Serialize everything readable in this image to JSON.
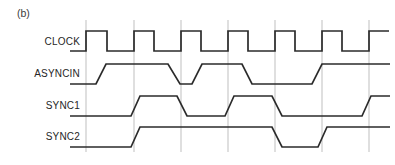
{
  "figure": {
    "caption": "(b)",
    "background": "#ffffff",
    "width": 395,
    "height": 165
  },
  "colors": {
    "wave_stroke": "#2b2b2b",
    "grid_stroke": "#bfbfbf",
    "label_text": "#262626",
    "caption_text": "#3b3b3b"
  },
  "grid": {
    "label": "clock-edge-gridlines",
    "x_positions": [
      86,
      134,
      181,
      228,
      275,
      322,
      369
    ],
    "y_top": 20,
    "y_bottom": 152
  },
  "chart_data": {
    "type": "line",
    "title": "(b)",
    "xlabel": "",
    "ylabel": "",
    "subtitle": "Digital timing diagram: two-stage synchronizer",
    "grid": true,
    "legend_position": "left-axis-labels",
    "x_axis": {
      "type": "time",
      "start": 70,
      "end": 390,
      "clock_period_px": 47,
      "clock_high_px": 21,
      "gridlines_at_rising_edges": true,
      "tick_labels": []
    },
    "signals": [
      {
        "name": "CLOCK",
        "label": "CLOCK",
        "y_high": 31,
        "y_low": 51,
        "edge_style": "square",
        "initial_level": "low",
        "transitions_px": [
          86,
          107,
          134,
          154,
          181,
          201,
          228,
          248,
          275,
          295,
          322,
          342,
          369,
          389
        ],
        "points": "70,51 86,51 86,31 107,31 107,51 134,51 134,31 154,31 154,51 181,51 181,31 201,31 201,51 228,51 228,31 248,31 248,51 275,51 275,31 295,31 295,51 322,51 322,31 342,31 342,51 369,51 369,31 389,31"
      },
      {
        "name": "ASYNCIN",
        "label": "ASYNCIN",
        "y_high": 64,
        "y_low": 84,
        "edge_style": "slanted",
        "initial_level": "low",
        "transitions_px": [
          96,
          106,
          168,
          180,
          192,
          202,
          242,
          252,
          312,
          322
        ],
        "points": "70,84 96,84 106,64 168,64 180,84 192,84 202,64 242,64 252,84 312,84 322,64 390,64"
      },
      {
        "name": "SYNC1",
        "label": "SYNC1",
        "y_high": 96,
        "y_low": 116,
        "edge_style": "slanted",
        "initial_level": "low",
        "transitions_px": [
          131,
          140,
          177,
          187,
          225,
          234,
          272,
          282,
          362,
          371
        ],
        "points": "70,116 131,116 140,96 177,96 187,116 225,116 234,96 272,96 282,116 362,116 371,96 390,96"
      },
      {
        "name": "SYNC2",
        "label": "SYNC2",
        "y_high": 127,
        "y_low": 147,
        "edge_style": "slanted",
        "initial_level": "low",
        "transitions_px": [
          131,
          140,
          272,
          282,
          318,
          327
        ],
        "points": "70,147 131,147 140,127 272,127 282,147 318,147 327,127 390,127"
      }
    ]
  },
  "signal_labels": [
    {
      "text": "CLOCK",
      "x": 80,
      "y": 45
    },
    {
      "text": "ASYNCIN",
      "x": 80,
      "y": 77
    },
    {
      "text": "SYNC1",
      "x": 80,
      "y": 109
    },
    {
      "text": "SYNC2",
      "x": 80,
      "y": 140
    }
  ]
}
